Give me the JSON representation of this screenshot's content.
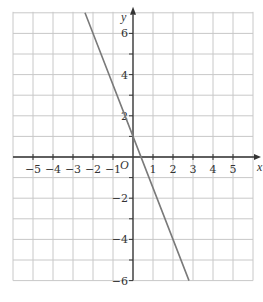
{
  "chart_data": {
    "type": "line",
    "title": "",
    "xlabel": "x",
    "ylabel": "y",
    "origin_label": "O",
    "xlim": [
      -6,
      6
    ],
    "ylim": [
      -6,
      7
    ],
    "grid": true,
    "x_ticks": [
      -5,
      -4,
      -3,
      -2,
      -1,
      1,
      2,
      3,
      4,
      5
    ],
    "x_tick_labels": [
      "−5",
      "−4",
      "−3",
      "−2",
      "−1",
      "1",
      "2",
      "3",
      "4",
      "5"
    ],
    "y_ticks": [
      6,
      4,
      2,
      -2,
      -4,
      -6
    ],
    "y_tick_labels": [
      "6",
      "4",
      "2",
      "−2",
      "−4",
      "−6"
    ],
    "series": [
      {
        "name": "line",
        "equation": "y = -2.5x + 1",
        "slope": -2.5,
        "intercept": 1,
        "x": [
          -2.4,
          0,
          2.8
        ],
        "y": [
          7,
          1,
          -6
        ]
      }
    ],
    "legend": null
  },
  "colors": {
    "grid": "#c8c8c8",
    "axis": "#333333",
    "line": "#7a7a7a"
  }
}
